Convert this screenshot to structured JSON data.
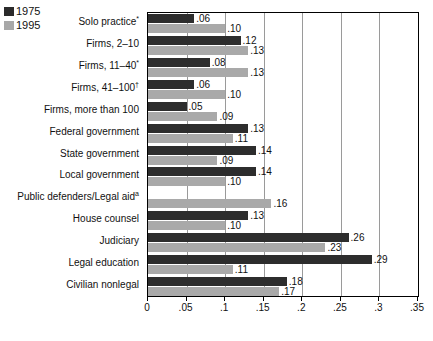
{
  "legend": {
    "items": [
      {
        "label": "1975",
        "color": "#2d2d2d"
      },
      {
        "label": "1995",
        "color": "#a9a9a9"
      }
    ]
  },
  "chart_data": {
    "type": "bar",
    "orientation": "horizontal",
    "title": "",
    "xlabel": "",
    "ylabel": "",
    "xlim": [
      0,
      0.35
    ],
    "xticks": [
      "0",
      ".05",
      ".1",
      ".15",
      ".2",
      ".25",
      ".3",
      ".35"
    ],
    "xtick_values": [
      0,
      0.05,
      0.1,
      0.15,
      0.2,
      0.25,
      0.3,
      0.35
    ],
    "grid": true,
    "legend_position": "top-left",
    "categories": [
      "Solo practice*",
      "Firms, 2–10",
      "Firms, 11–40*",
      "Firms, 41–100†",
      "Firms, more than 100",
      "Federal government",
      "State government",
      "Local government",
      "Public defenders/Legal aidᵃ",
      "House counsel",
      "Judiciary",
      "Legal education",
      "Civilian nonlegal"
    ],
    "series": [
      {
        "name": "1975",
        "color": "#2d2d2d",
        "values": [
          0.06,
          0.12,
          0.08,
          0.06,
          0.05,
          0.13,
          0.14,
          0.14,
          null,
          0.13,
          0.26,
          0.29,
          0.18
        ],
        "labels": [
          ".06",
          ".12",
          ".08",
          ".06",
          ".05",
          ".13",
          ".14",
          ".14",
          "",
          ".13",
          ".26",
          ".29",
          ".18"
        ]
      },
      {
        "name": "1995",
        "color": "#a9a9a9",
        "values": [
          0.1,
          0.13,
          0.13,
          0.1,
          0.09,
          0.11,
          0.09,
          0.1,
          0.16,
          0.1,
          0.23,
          0.11,
          0.17
        ],
        "labels": [
          ".10",
          ".13",
          ".13",
          ".10",
          ".09",
          ".11",
          ".09",
          ".10",
          ".16",
          ".10",
          ".23",
          ".11",
          ".17"
        ]
      }
    ]
  }
}
